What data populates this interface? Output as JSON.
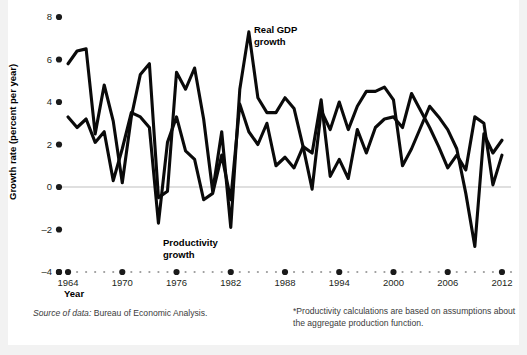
{
  "chart_data": {
    "type": "line",
    "title": "",
    "xlabel": "Year",
    "ylabel": "Growth rate (percent per year)",
    "xlim": [
      1963,
      2013
    ],
    "ylim": [
      -4,
      8
    ],
    "yticks": [
      8,
      6,
      4,
      2,
      0,
      -2,
      -4
    ],
    "ytick_labels": [
      "8",
      "6",
      "4",
      "2",
      "0",
      "-2",
      "-4"
    ],
    "xticks": [
      1964,
      1970,
      1976,
      1982,
      1988,
      1994,
      2000,
      2006,
      2012
    ],
    "xtick_labels": [
      "1964",
      "1970",
      "1976",
      "1982",
      "1988",
      "1994",
      "2000",
      "2006",
      "2012"
    ],
    "grid": false,
    "zero_line": true,
    "legend_position": "inline-annotations",
    "x": [
      1964,
      1965,
      1966,
      1967,
      1968,
      1969,
      1970,
      1971,
      1972,
      1973,
      1974,
      1975,
      1976,
      1977,
      1978,
      1979,
      1980,
      1981,
      1982,
      1983,
      1984,
      1985,
      1986,
      1987,
      1988,
      1989,
      1990,
      1991,
      1992,
      1993,
      1994,
      1995,
      1996,
      1997,
      1998,
      1999,
      2000,
      2001,
      2002,
      2003,
      2004,
      2005,
      2006,
      2007,
      2008,
      2009,
      2010,
      2011,
      2012
    ],
    "series": [
      {
        "name": "Real GDP growth",
        "label": "Real GDP\ngrowth",
        "color": "#0a0a0a",
        "values": [
          5.8,
          6.4,
          6.5,
          2.5,
          4.8,
          3.1,
          0.2,
          3.3,
          5.3,
          5.8,
          -0.5,
          -0.2,
          5.4,
          4.6,
          5.6,
          3.2,
          -0.2,
          2.6,
          -1.9,
          4.6,
          7.3,
          4.2,
          3.5,
          3.5,
          4.2,
          3.7,
          1.9,
          -0.1,
          3.6,
          2.7,
          4.0,
          2.7,
          3.8,
          4.5,
          4.5,
          4.7,
          4.1,
          1.0,
          1.8,
          2.8,
          3.8,
          3.3,
          2.7,
          1.8,
          -0.3,
          -2.8,
          2.5,
          1.6,
          2.2
        ]
      },
      {
        "name": "Productivity growth",
        "label": "Productivity\ngrowth",
        "color": "#0a0a0a",
        "values": [
          3.3,
          2.8,
          3.2,
          2.1,
          2.6,
          0.3,
          1.8,
          3.5,
          3.3,
          2.8,
          -1.7,
          2.1,
          3.3,
          1.7,
          1.3,
          -0.6,
          -0.3,
          1.5,
          -0.6,
          3.9,
          2.6,
          2.0,
          3.0,
          1.0,
          1.4,
          0.9,
          1.9,
          1.6,
          4.1,
          0.5,
          1.3,
          0.4,
          2.7,
          1.6,
          2.8,
          3.2,
          3.3,
          2.8,
          4.4,
          3.6,
          2.8,
          1.9,
          0.9,
          1.5,
          0.8,
          3.3,
          3.0,
          0.1,
          1.5
        ]
      }
    ],
    "annotations": [
      {
        "text": "Real GDP growth",
        "x": 1985,
        "y": 6.6
      },
      {
        "text": "Productivity growth",
        "x": 1978,
        "y": -2.6
      }
    ]
  },
  "axis": {
    "x_title": "Year",
    "y_title": "Growth rate (percent per year)"
  },
  "labels": {
    "gdp_line1": "Real GDP",
    "gdp_line2": "growth",
    "prod_line1": "Productivity",
    "prod_line2": "growth"
  },
  "footnotes": {
    "source_prefix": "Source of data:",
    "source_body": "Bureau of Economic Analysis.",
    "note_line1": "*Productivity calculations are based on assumptions",
    "note_line2": "about the aggregate production function."
  },
  "colors": {
    "page_background": "#f2f2f2",
    "card_background": "#ffffff",
    "line": "#0a0a0a",
    "text": "#231f20",
    "muted_text": "#3b3b3b",
    "zero_line": "#bfbfbf",
    "dot": "#1a1a1a"
  }
}
